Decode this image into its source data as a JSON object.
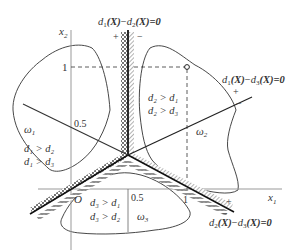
{
  "figure": {
    "axes": {
      "x_label": "x",
      "x_sub": "1",
      "y_label": "x",
      "y_sub": "2",
      "origin_label": "O",
      "x_ticks": [
        "0.5",
        "1"
      ],
      "y_ticks": [
        "1",
        "0.5"
      ]
    },
    "boundaries": {
      "d12": {
        "lhs_a": "d",
        "sub_a": "1",
        "mid": "(X)",
        "minus": "−",
        "lhs_b": "d",
        "sub_b": "2",
        "rhs": "(X)=0",
        "plus": "+",
        "minus_sign": "−"
      },
      "d13": {
        "lhs_a": "d",
        "sub_a": "1",
        "mid": "(X)",
        "minus": "−",
        "lhs_b": "d",
        "sub_b": "3",
        "rhs": "(X)=0",
        "plus": "+",
        "minus_sign": "−"
      },
      "d23": {
        "lhs_a": "d",
        "sub_a": "2",
        "mid": "(X)",
        "minus": "−",
        "lhs_b": "d",
        "sub_b": "3",
        "rhs": "(X)=0",
        "plus": "+",
        "minus_sign": "−"
      }
    },
    "regions": {
      "omega1": {
        "label": "ω",
        "sub": "1",
        "cond1": "d₁ > d₂",
        "cond2": "d₁ > d₃"
      },
      "omega2": {
        "label": "ω",
        "sub": "2",
        "cond1": "d₂ > d₁",
        "cond2": "d₂ > d₃"
      },
      "omega3": {
        "label": "ω",
        "sub": "3",
        "cond1": "d₃ > d₁",
        "cond2": "d₃ > d₂"
      }
    },
    "colors": {
      "axis": "#999999",
      "line": "#222222",
      "curve": "#333333",
      "text": "#333333"
    }
  }
}
